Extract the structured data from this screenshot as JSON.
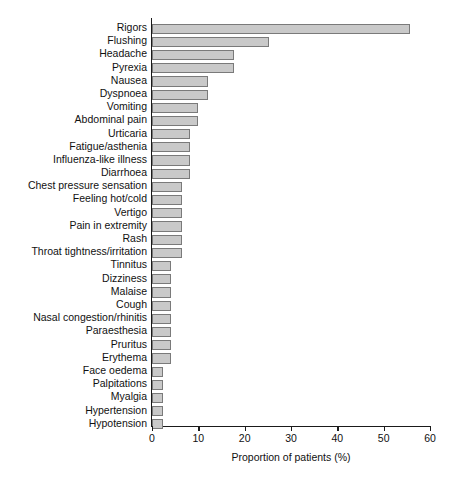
{
  "chart_data": {
    "type": "bar",
    "orientation": "horizontal",
    "title": "",
    "xlabel": "Proportion of patients (%)",
    "ylabel": "",
    "xlim": [
      0,
      60
    ],
    "xticks": [
      0,
      10,
      20,
      30,
      40,
      50,
      60
    ],
    "grid": false,
    "legend": null,
    "bar_color": "#c9c9c9",
    "bar_edge_color": "#7a7a7a",
    "axis_color": "#1a1a1a",
    "categories": [
      "Rigors",
      "Flushing",
      "Headache",
      "Pyrexia",
      "Nausea",
      "Dyspnoea",
      "Vomiting",
      "Abdominal pain",
      "Urticaria",
      "Fatigue/asthenia",
      "Influenza-like illness",
      "Diarrhoea",
      "Chest pressure sensation",
      "Feeling hot/cold",
      "Vertigo",
      "Pain in extremity",
      "Rash",
      "Throat tightness/irritation",
      "Tinnitus",
      "Dizziness",
      "Malaise",
      "Cough",
      "Nasal congestion/rhinitis",
      "Paraesthesia",
      "Pruritus",
      "Erythema",
      "Face oedema",
      "Palpitations",
      "Myalgia",
      "Hypertension",
      "Hypotension"
    ],
    "values": [
      55.6,
      25.3,
      17.6,
      17.6,
      12.0,
      12.0,
      10.0,
      10.0,
      8.2,
      8.2,
      8.2,
      8.2,
      6.4,
      6.4,
      6.4,
      6.4,
      6.4,
      6.4,
      4.2,
      4.2,
      4.2,
      4.2,
      4.2,
      4.2,
      4.2,
      4.2,
      2.4,
      2.4,
      2.4,
      2.4,
      2.4
    ]
  }
}
